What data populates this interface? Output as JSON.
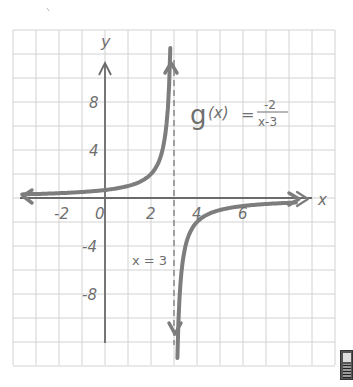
{
  "chart_data": {
    "type": "line",
    "title": "",
    "function_label": "g(x) = -2/(x-3)",
    "function_label_parts": {
      "name": "g",
      "arg": "(x)",
      "equals": "=",
      "numerator": "-2",
      "denominator": "x-3"
    },
    "asymptote_label": "x = 3",
    "xlabel": "x",
    "ylabel": "y",
    "x_ticks": [
      -2,
      0,
      2,
      4,
      6
    ],
    "x_tick_labels": [
      "-2",
      "0",
      "2",
      "4",
      "6"
    ],
    "y_ticks": [
      8,
      4,
      -4,
      -8
    ],
    "y_tick_labels": [
      "8",
      "4",
      "-4",
      "-8"
    ],
    "xlim": [
      -4,
      10
    ],
    "ylim": [
      -14,
      14
    ],
    "grid": true,
    "grid_step": {
      "x": 1,
      "y": 2
    },
    "vertical_asymptote": 3,
    "horizontal_asymptote": 0,
    "series": [
      {
        "name": "g(x) left branch",
        "x": [
          -3.5,
          -2,
          0,
          1,
          2,
          2.5,
          2.8
        ],
        "y": [
          0.31,
          0.4,
          0.67,
          1,
          2,
          4,
          10
        ]
      },
      {
        "name": "g(x) right branch",
        "x": [
          3.15,
          3.5,
          4,
          5,
          6,
          8.5
        ],
        "y": [
          -13.3,
          -4,
          -2,
          -1,
          -0.67,
          -0.36
        ]
      }
    ],
    "colors": {
      "curve": "#7a7a7a",
      "axes": "#6a6a6a",
      "grid": "#d2d2d2",
      "text": "#6f6f6f"
    }
  }
}
